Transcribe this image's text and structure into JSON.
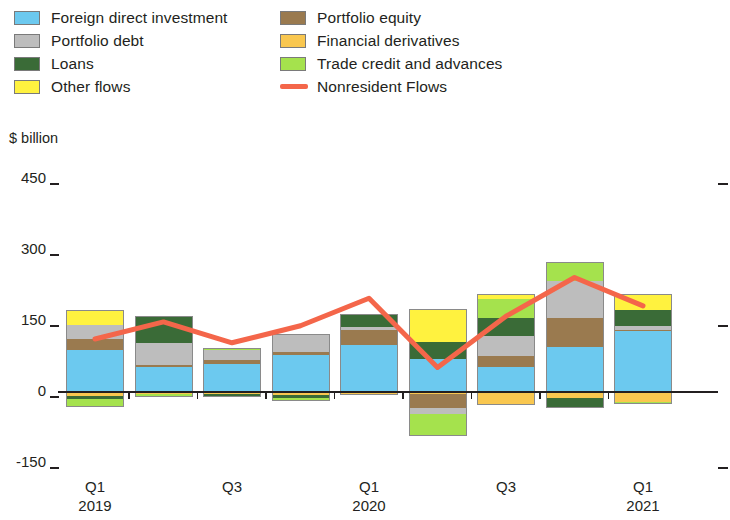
{
  "legend": {
    "columns": [
      [
        {
          "label": "Foreign direct investment",
          "key": "fdi",
          "color": "#6cc9ef",
          "type": "swatch"
        },
        {
          "label": "Portfolio debt",
          "key": "pdebt",
          "color": "#bdbdbd",
          "type": "swatch"
        },
        {
          "label": "Loans",
          "key": "loans",
          "color": "#3a6b37",
          "type": "swatch"
        },
        {
          "label": "Other flows",
          "key": "other",
          "color": "#fff23f",
          "type": "swatch"
        }
      ],
      [
        {
          "label": "Portfolio equity",
          "key": "pequity",
          "color": "#9a7a4f",
          "type": "swatch"
        },
        {
          "label": "Financial derivatives",
          "key": "fderiv",
          "color": "#f9c košt",
          "type": "swatch"
        },
        {
          "label": "Trade credit and advances",
          "key": "trade",
          "color": "#a5e24d",
          "type": "swatch"
        },
        {
          "label": "Nonresident Flows",
          "key": "nonresident",
          "color": "#f4664a",
          "type": "line"
        }
      ]
    ]
  },
  "axis": {
    "y_title": "$ billion",
    "y_ticks": [
      450,
      300,
      150,
      0,
      -150
    ],
    "y_tick_labels": [
      "450",
      "300",
      "150",
      "0",
      "-150"
    ],
    "y_min": -150,
    "y_max": 450,
    "x_labels": [
      {
        "quarter": "Q1",
        "year": "2019",
        "index": 0
      },
      {
        "quarter": "Q3",
        "year": "",
        "index": 2
      },
      {
        "quarter": "Q1",
        "year": "2020",
        "index": 4
      },
      {
        "quarter": "Q3",
        "year": "",
        "index": 6
      },
      {
        "quarter": "Q1",
        "year": "2021",
        "index": 8
      }
    ]
  },
  "chart_data": {
    "type": "bar",
    "title": "",
    "subtitle": "",
    "xlabel": "",
    "ylabel": "$ billion",
    "ylim": [
      -150,
      450
    ],
    "grid": false,
    "stacked": true,
    "legend_position": "top",
    "categories": [
      "Q1 2019",
      "Q2 2019",
      "Q3 2019",
      "Q4 2019",
      "Q1 2020",
      "Q2 2020",
      "Q3 2020",
      "Q4 2020",
      "Q1 2021"
    ],
    "series": [
      {
        "name": "Foreign direct investment",
        "color": "#6cc9ef",
        "values": [
          88,
          52,
          60,
          78,
          100,
          70,
          52,
          95,
          128
        ]
      },
      {
        "name": "Portfolio equity",
        "color": "#9a7a4f",
        "values": [
          24,
          6,
          8,
          6,
          30,
          -30,
          24,
          62,
          4
        ]
      },
      {
        "name": "Portfolio debt",
        "color": "#bdbdbd",
        "values": [
          30,
          45,
          20,
          38,
          8,
          -12,
          42,
          78,
          8
        ]
      },
      {
        "name": "Financial derivatives",
        "color": "#f9c74f",
        "values": [
          -8,
          -4,
          -4,
          -6,
          -6,
          -4,
          -28,
          -12,
          -22
        ]
      },
      {
        "name": "Loans",
        "color": "#3a6b37",
        "values": [
          -6,
          58,
          -6,
          -6,
          26,
          36,
          38,
          -22,
          34
        ]
      },
      {
        "name": "Trade credit and advances",
        "color": "#a5e24d",
        "values": [
          -18,
          -6,
          4,
          -6,
          0,
          -48,
          40,
          40,
          -4
        ]
      },
      {
        "name": "Other flows",
        "color": "#fff23f",
        "values": [
          32,
          0,
          0,
          0,
          0,
          70,
          12,
          0,
          32
        ]
      }
    ],
    "line_series": {
      "name": "Nonresident Flows",
      "color": "#f4664a",
      "values": [
        112,
        148,
        104,
        140,
        198,
        52,
        160,
        242,
        182
      ]
    }
  }
}
